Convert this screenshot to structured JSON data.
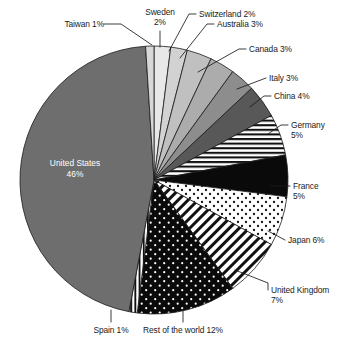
{
  "chart_data": {
    "type": "pie",
    "title": "",
    "subtitle": "",
    "xlabel": "",
    "ylabel": "",
    "legend_position": "none",
    "grid": false,
    "units": "percent",
    "start_angle_deg": 0,
    "direction": "clockwise",
    "categories": [
      "Sweden",
      "Switzerland",
      "Australia",
      "Canada",
      "Italy",
      "China",
      "Germany",
      "France",
      "Japan",
      "United Kingdom",
      "Rest of the world",
      "Spain",
      "United States",
      "Taiwan"
    ],
    "values": [
      2,
      2,
      3,
      3,
      3,
      4,
      5,
      5,
      6,
      7,
      12,
      1,
      46,
      1
    ],
    "slices": [
      {
        "name": "Sweden",
        "value": 2,
        "label": "Sweden",
        "percent": "2%",
        "label_text": "Sweden 2%",
        "fill": "#e8e8e8",
        "pattern": "solid"
      },
      {
        "name": "Switzerland",
        "value": 2,
        "label": "Switzerland",
        "percent": "2%",
        "label_text": "Switzerland 2%",
        "fill": "#d2d2d2",
        "pattern": "solid"
      },
      {
        "name": "Australia",
        "value": 3,
        "label": "Australia",
        "percent": "3%",
        "label_text": "Australia 3%",
        "fill": "#c0c0c0",
        "pattern": "solid"
      },
      {
        "name": "Canada",
        "value": 3,
        "label": "Canada",
        "percent": "3%",
        "label_text": "Canada 3%",
        "fill": "#acacac",
        "pattern": "solid"
      },
      {
        "name": "Italy",
        "value": 3,
        "label": "Italy",
        "percent": "3%",
        "label_text": "Italy 3%",
        "fill": "#8d8d8d",
        "pattern": "solid"
      },
      {
        "name": "China",
        "value": 4,
        "label": "China",
        "percent": "4%",
        "label_text": "China 4%",
        "fill": "#585858",
        "pattern": "solid"
      },
      {
        "name": "Germany",
        "value": 5,
        "label": "Germany",
        "percent": "5%",
        "label_text": "Germany 5%",
        "fill": "#ffffff",
        "pattern": "horizontal-stripes"
      },
      {
        "name": "France",
        "value": 5,
        "label": "France",
        "percent": "5%",
        "label_text": "France 5%",
        "fill": "#0a0a0a",
        "pattern": "solid"
      },
      {
        "name": "Japan",
        "value": 6,
        "label": "Japan",
        "percent": "6%",
        "label_text": "Japan 6%",
        "fill": "#ffffff",
        "pattern": "black-dots"
      },
      {
        "name": "United Kingdom",
        "value": 7,
        "label": "United Kingdom",
        "percent": "7%",
        "label_text": "United Kingdom 7%",
        "fill": "#ffffff",
        "pattern": "diagonal-hatch"
      },
      {
        "name": "Rest of the world",
        "value": 12,
        "label": "Rest of the world",
        "percent": "12%",
        "label_text": "Rest of the world 12%",
        "fill": "#0a0a0a",
        "pattern": "white-dots"
      },
      {
        "name": "Spain",
        "value": 1,
        "label": "Spain",
        "percent": "1%",
        "label_text": "Spain 1%",
        "fill": "#ffffff",
        "pattern": "vertical-stripes"
      },
      {
        "name": "United States",
        "value": 46,
        "label": "United States",
        "percent": "46%",
        "label_text": "United States 46%",
        "fill": "#6e6e6e",
        "pattern": "solid"
      },
      {
        "name": "Taiwan",
        "value": 1,
        "label": "Taiwan",
        "percent": "1%",
        "label_text": "Taiwan 1%",
        "fill": "#d8d8d8",
        "pattern": "solid"
      }
    ]
  },
  "labels": {
    "taiwan": "Taiwan 1%",
    "sweden_l1": "Sweden",
    "sweden_l2": "2%",
    "switzerland": "Switzerland 2%",
    "australia": "Australia 3%",
    "canada": "Canada 3%",
    "italy": "Italy 3%",
    "china": "China 4%",
    "germany_l1": "Germany",
    "germany_l2": "5%",
    "france_l1": "France",
    "france_l2": "5%",
    "japan": "Japan 6%",
    "united_kingdom_l1": "United Kingdom",
    "united_kingdom_l2": "7%",
    "rest_of_world": "Rest of the world 12%",
    "spain": "Spain 1%",
    "united_states_l1": "United States",
    "united_states_l2": "46%"
  },
  "colors": {
    "background": "#ffffff",
    "text": "#1a1a1a",
    "inside_text": "#ffffff",
    "leader_line": "#1a1a1a",
    "slice_outline": "#1a1a1a"
  }
}
